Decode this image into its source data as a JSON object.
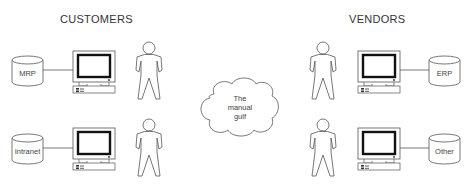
{
  "titles": {
    "left": "CUSTOMERS",
    "right": "VENDORS"
  },
  "cloud": {
    "lines": [
      "The",
      "manual",
      "gulf"
    ]
  },
  "databases": {
    "customer_top": "MRP",
    "customer_bottom": "Intranet",
    "vendor_top": "ERP",
    "vendor_bottom": "Other"
  },
  "colors": {
    "stroke": "#555555",
    "background": "#ffffff"
  }
}
